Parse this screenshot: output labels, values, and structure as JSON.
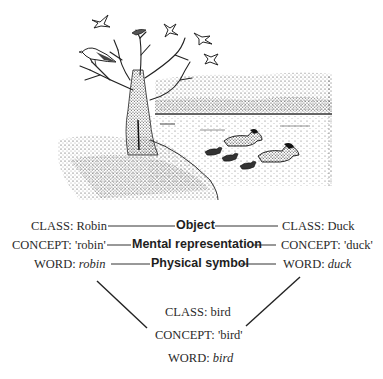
{
  "illustration": {
    "description": "Ink drawing: bare tree with robin perched on branch, small bird atop tree, four birds flying, lake with reeds, two adult ducks and three ducklings swimming",
    "elements": [
      "tree",
      "robin",
      "flying-birds",
      "lake",
      "reeds",
      "ducks",
      "ducklings",
      "grassy-bank"
    ]
  },
  "rows": [
    {
      "left": {
        "prefix": "CLASS: ",
        "value": "Robin",
        "italic": false
      },
      "middle": "Object",
      "right": {
        "prefix": "CLASS: ",
        "value": "Duck",
        "italic": false
      }
    },
    {
      "left": {
        "prefix": "CONCEPT: ",
        "value": "'robin'",
        "italic": false
      },
      "middle": "Mental representation",
      "right": {
        "prefix": "CONCEPT: ",
        "value": "'duck'",
        "italic": false
      }
    },
    {
      "left": {
        "prefix": "WORD: ",
        "value": "robin",
        "italic": true
      },
      "middle": "Physical symbol",
      "right": {
        "prefix": "WORD: ",
        "value": "duck",
        "italic": true
      }
    }
  ],
  "bottom": {
    "class": {
      "prefix": "CLASS: ",
      "value": "bird"
    },
    "concept": {
      "prefix": "CONCEPT: ",
      "value": "'bird'"
    },
    "word": {
      "prefix": "WORD: ",
      "value": "bird"
    }
  },
  "colors": {
    "ink": "#2a2a2a",
    "background": "#ffffff"
  }
}
